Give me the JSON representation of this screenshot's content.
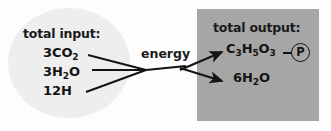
{
  "diagram": {
    "colors": {
      "background": "#fdfdfd",
      "input_circle": "#eeeeee",
      "output_box": "#a6a6a6",
      "text": "#141414",
      "arrow": "#141414"
    },
    "input": {
      "heading": "total input:",
      "items": [
        {
          "label": "3CO2",
          "formula": "3CO",
          "sub": "2",
          "tail": ""
        },
        {
          "label": "3H2O",
          "formula": "3H",
          "sub": "2",
          "tail": "O"
        },
        {
          "label": "12H",
          "formula": "12H",
          "sub": "",
          "tail": ""
        }
      ]
    },
    "output": {
      "heading": "total output:",
      "items": [
        {
          "label": "C3H5O3-P",
          "prefix": "C",
          "sub1": "3",
          "mid1": "H",
          "sub2": "5",
          "mid2": "O",
          "sub3": "3"
        },
        {
          "label": "6H2O",
          "prefix": "6H",
          "sub1": "2",
          "mid1": "O"
        }
      ],
      "phosphate": {
        "symbol": "P",
        "name": "circled-phosphate"
      }
    },
    "connector": {
      "label": "energy",
      "input_line_count": 3,
      "output_arrow_count": 2
    }
  }
}
